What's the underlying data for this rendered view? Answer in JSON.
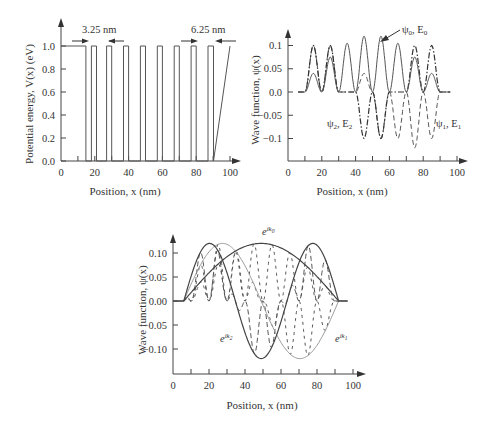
{
  "chart_data": [
    {
      "type": "line",
      "title": "",
      "xlabel": "Position, x (nm)",
      "ylabel": "Potential energy, V(x) (eV)",
      "xlim": [
        0,
        100
      ],
      "ylim": [
        0,
        1.1
      ],
      "xticks": [
        "0",
        "20",
        "40",
        "60",
        "80",
        "100"
      ],
      "yticks": [
        "0.0",
        "0.2",
        "0.4",
        "0.6",
        "0.8",
        "1.0"
      ],
      "grid": false,
      "annotations": [
        "3.25 nm",
        "6.25 nm"
      ],
      "series": [
        {
          "name": "V(x)",
          "style": "solid",
          "x": [
            0,
            14.75,
            14.75,
            18,
            18,
            21,
            21,
            27,
            27,
            30,
            30,
            37,
            37,
            40,
            40,
            47,
            47,
            50,
            50,
            57,
            57,
            60,
            60,
            67,
            67,
            70,
            70,
            77,
            77,
            80,
            80,
            87,
            87,
            90.25,
            90.25,
            100
          ],
          "y": [
            1,
            1,
            0,
            0,
            1,
            1,
            0,
            0,
            1,
            1,
            0,
            0,
            1,
            1,
            0,
            0,
            1,
            1,
            0,
            0,
            1,
            1,
            0,
            0,
            1,
            1,
            0,
            0,
            1,
            1,
            0,
            0,
            1,
            1,
            0,
            1
          ]
        }
      ],
      "barrier_width_nm": 3.25,
      "edge_well_width_nm": 6.25
    },
    {
      "type": "line",
      "title": "",
      "xlabel": "Position, x (nm)",
      "ylabel": "Wave function, ψ(x)",
      "xlim": [
        0,
        100
      ],
      "ylim": [
        -0.15,
        0.15
      ],
      "xticks": [
        "0",
        "20",
        "40",
        "60",
        "80",
        "100"
      ],
      "yticks": [
        "0.1",
        "0.05",
        "0.0",
        "-0.05",
        "-0.1"
      ],
      "grid": false,
      "legend": [
        "ψ0, E0",
        "ψ1, E1",
        "ψ2, E2"
      ],
      "series": [
        {
          "name": "ψ0, E0",
          "style": "solid",
          "well_centers": [
            15,
            25,
            35,
            45,
            55,
            65,
            75,
            85
          ],
          "peaks": [
            0.04,
            0.075,
            0.105,
            0.12,
            0.12,
            0.105,
            0.075,
            0.04
          ]
        },
        {
          "name": "ψ1, E1",
          "style": "dashed",
          "well_centers": [
            15,
            25,
            35,
            45,
            55,
            65,
            75,
            85
          ],
          "peaks": [
            0.1,
            0.1,
            0.0,
            0.04,
            -0.1,
            -0.1,
            -0.12,
            -0.1
          ]
        },
        {
          "name": "ψ2, E2",
          "style": "dash-dot",
          "well_centers": [
            15,
            25,
            35,
            45,
            55,
            65,
            75,
            85
          ],
          "peaks": [
            0.1,
            0.1,
            0.0,
            -0.1,
            -0.1,
            0.0,
            0.1,
            0.1
          ]
        }
      ]
    },
    {
      "type": "line",
      "title": "",
      "xlabel": "Position, x (nm)",
      "ylabel": "Wave function, ψ(x)",
      "xlim": [
        0,
        100
      ],
      "ylim": [
        -0.15,
        0.15
      ],
      "xticks": [
        "0",
        "20",
        "40",
        "60",
        "80",
        "100"
      ],
      "yticks": [
        "0.10",
        "0.05",
        "0.00",
        "-0.05",
        "-0.10"
      ],
      "grid": false,
      "legend": [
        "e^{ik0}",
        "e^{ik1}",
        "e^{ik2}"
      ],
      "series": [
        {
          "name": "e^{ik0}",
          "style": "solid dark",
          "description": "half-sine envelope from x=6 to x=92, peak 0.12 at x≈49"
        },
        {
          "name": "e^{ik1}",
          "style": "solid light",
          "description": "full-sine envelope from x=6 to x=92, +0.12 at x≈27, -0.12 at x≈71"
        },
        {
          "name": "e^{ik2}",
          "style": "solid dark",
          "description": "1.5-period sine envelope from x=6 to x=92, +0.12 at x≈20, -0.12 at x≈49, +0.12 at x≈78"
        }
      ]
    }
  ],
  "plot1": {
    "ylabel": "Potential energy, V(x) (eV)",
    "xlabel": "Position, x (nm)",
    "xticks": [
      "0",
      "20",
      "40",
      "60",
      "80",
      "100"
    ],
    "yticks": [
      "1.0",
      "0.8",
      "0.6",
      "0.4",
      "0.2",
      "0.0"
    ],
    "annot_left": "3.25 nm",
    "annot_right": "6.25 nm"
  },
  "plot2": {
    "ylabel": "Wave function, ψ(x)",
    "xlabel": "Position, x (nm)",
    "xticks": [
      "0",
      "20",
      "40",
      "60",
      "80",
      "100"
    ],
    "yticks": [
      "0.1",
      "0.05",
      "0.0",
      "−0.05",
      "−0.1"
    ],
    "label_psi0": "ψ",
    "label_psi0_sub": "0",
    "label_psi0_e": ", E",
    "label_psi0_esub": "0",
    "label_psi1": "ψ",
    "label_psi1_sub": "1",
    "label_psi1_e": ", E",
    "label_psi1_esub": "1",
    "label_psi2": "ψ",
    "label_psi2_sub": "2",
    "label_psi2_e": ", E",
    "label_psi2_esub": "2"
  },
  "plot3": {
    "ylabel": "Wave function, ψ(x)",
    "xlabel": "Position, x (nm)",
    "xticks": [
      "0",
      "20",
      "40",
      "60",
      "80",
      "100"
    ],
    "yticks": [
      "0.10",
      "0.05",
      "0.00",
      "−0.05",
      "−0.10"
    ],
    "label_k0_base": "e",
    "label_k0_sup": "ik",
    "label_k0_sub": "0",
    "label_k1_base": "e",
    "label_k1_sup": "ik",
    "label_k1_sub": "1",
    "label_k2_base": "e",
    "label_k2_sup": "ik",
    "label_k2_sub": "2"
  }
}
